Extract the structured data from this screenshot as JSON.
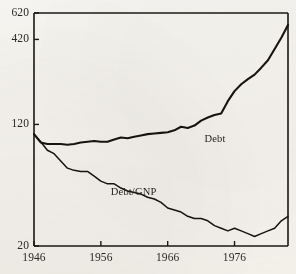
{
  "figure": {
    "background_color": "#f7f5f1",
    "ink_color": "#1b1815",
    "frame": {
      "left": 34,
      "right": 288,
      "top": 13,
      "bottom": 246
    }
  },
  "chart_data": {
    "type": "line",
    "title": "",
    "subtitle": "",
    "xlabel": "",
    "ylabel": "",
    "grid": false,
    "legend_position": "inline-annotation",
    "xlim": [
      1946,
      1984
    ],
    "ylim": [
      20,
      620
    ],
    "yscale": "log",
    "xticks": [
      1946,
      1956,
      1966,
      1976
    ],
    "xtick_labels": [
      "1946",
      "1956",
      "1966",
      "1976"
    ],
    "yticks": [
      20,
      120,
      420,
      620
    ],
    "ytick_labels": [
      "20",
      "120",
      "420",
      "620"
    ],
    "annotations": [
      {
        "text": "Debt",
        "x": 1971.5,
        "y": 95
      },
      {
        "text": "Debt/GNP",
        "x": 1957.5,
        "y": 44
      }
    ],
    "series": [
      {
        "name": "Debt",
        "label": "Debt",
        "x": [
          1946,
          1947,
          1948,
          1949,
          1950,
          1951,
          1952,
          1953,
          1954,
          1955,
          1956,
          1957,
          1958,
          1959,
          1960,
          1961,
          1962,
          1963,
          1964,
          1965,
          1966,
          1967,
          1968,
          1969,
          1970,
          1971,
          1972,
          1973,
          1974,
          1975,
          1976,
          1977,
          1978,
          1979,
          1980,
          1981,
          1982,
          1983,
          1984
        ],
        "values": [
          104,
          92,
          90,
          90,
          90,
          89,
          90,
          92,
          93,
          94,
          93,
          93,
          96,
          99,
          98,
          100,
          102,
          104,
          105,
          106,
          107,
          110,
          116,
          114,
          118,
          127,
          133,
          138,
          141,
          169,
          196,
          217,
          234,
          250,
          277,
          309,
          365,
          430,
          520
        ]
      },
      {
        "name": "Debt/GNP",
        "label": "Debt/GNP",
        "x": [
          1946,
          1947,
          1948,
          1949,
          1950,
          1951,
          1952,
          1953,
          1954,
          1955,
          1956,
          1957,
          1958,
          1959,
          1960,
          1961,
          1962,
          1963,
          1964,
          1965,
          1966,
          1967,
          1968,
          1969,
          1970,
          1971,
          1972,
          1973,
          1974,
          1975,
          1976,
          1977,
          1978,
          1979,
          1980,
          1981,
          1982,
          1983,
          1984
        ],
        "values": [
          104,
          93,
          82,
          78,
          70,
          63,
          61,
          60,
          60,
          56,
          52,
          50,
          50,
          47,
          45,
          44,
          43,
          41,
          40,
          38,
          35,
          34,
          33,
          31,
          30,
          30,
          29,
          27,
          26,
          25,
          26,
          25,
          24,
          23,
          24,
          25,
          26,
          29,
          31
        ]
      }
    ]
  },
  "axes": {
    "y_labels": [
      {
        "text": "620",
        "value": 620
      },
      {
        "text": "420",
        "value": 420
      },
      {
        "text": "120",
        "value": 120
      },
      {
        "text": "20",
        "value": 20
      }
    ],
    "x_labels": [
      {
        "text": "1946",
        "value": 1946
      },
      {
        "text": "1956",
        "value": 1956
      },
      {
        "text": "1966",
        "value": 1966
      },
      {
        "text": "1976",
        "value": 1976
      }
    ]
  }
}
